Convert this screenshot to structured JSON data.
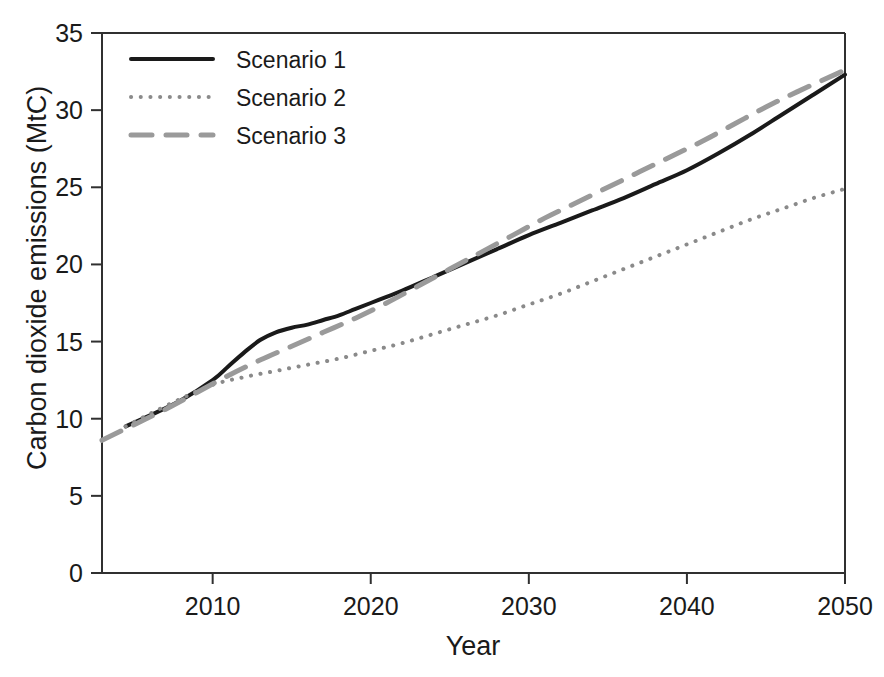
{
  "chart_data": {
    "type": "line",
    "title": "",
    "xlabel": "Year",
    "ylabel": "Carbon dioxide emissions (MtC)",
    "xlim": [
      2003,
      2050
    ],
    "ylim": [
      0,
      35
    ],
    "xticks": [
      2010,
      2020,
      2030,
      2040,
      2050
    ],
    "xtick_labels": [
      "2010",
      "2020",
      "2030",
      "2040",
      "2050"
    ],
    "yticks": [
      0,
      5,
      10,
      15,
      20,
      25,
      30,
      35
    ],
    "ytick_labels": [
      "0",
      "5",
      "10",
      "15",
      "20",
      "25",
      "30",
      "35"
    ],
    "grid": false,
    "legend_position": "upper left",
    "series": [
      {
        "name": "Scenario 1",
        "style": "solid",
        "color": "#1a1a1a",
        "width": 4.0,
        "x": [
          2004.5,
          2006,
          2008,
          2010,
          2011,
          2012,
          2013,
          2014,
          2015,
          2016,
          2017,
          2018,
          2019,
          2020,
          2021,
          2022,
          2024,
          2026,
          2028,
          2030,
          2032,
          2034,
          2036,
          2038,
          2040,
          2042,
          2044,
          2046,
          2048,
          2050
        ],
        "y": [
          9.5,
          10.2,
          11.2,
          12.5,
          13.4,
          14.3,
          15.1,
          15.6,
          15.9,
          16.1,
          16.4,
          16.7,
          17.1,
          17.5,
          17.9,
          18.3,
          19.2,
          20.1,
          21.0,
          21.9,
          22.7,
          23.5,
          24.3,
          25.2,
          26.1,
          27.2,
          28.4,
          29.7,
          31.0,
          32.3
        ]
      },
      {
        "name": "Scenario 2",
        "style": "dotted",
        "color": "#8a8a8a",
        "width": 4.0,
        "x": [
          2004.5,
          2006,
          2008,
          2010,
          2012,
          2014,
          2016,
          2018,
          2020,
          2022,
          2024,
          2026,
          2028,
          2030,
          2032,
          2034,
          2036,
          2038,
          2040,
          2042,
          2044,
          2046,
          2048,
          2050
        ],
        "y": [
          9.5,
          10.3,
          11.3,
          12.2,
          12.7,
          13.1,
          13.5,
          13.9,
          14.4,
          14.9,
          15.5,
          16.1,
          16.7,
          17.4,
          18.1,
          18.9,
          19.7,
          20.5,
          21.3,
          22.1,
          22.9,
          23.6,
          24.3,
          24.9
        ]
      },
      {
        "name": "Scenario 3",
        "style": "dashed",
        "color": "#9a9a9a",
        "width": 5.0,
        "x": [
          2003,
          2005,
          2007,
          2009,
          2011,
          2013,
          2015,
          2017,
          2019,
          2021,
          2023,
          2025,
          2027,
          2029,
          2031,
          2033,
          2035,
          2037,
          2039,
          2041,
          2043,
          2045,
          2047,
          2050
        ],
        "y": [
          8.6,
          9.6,
          10.6,
          11.7,
          12.8,
          13.8,
          14.7,
          15.6,
          16.5,
          17.5,
          18.6,
          19.7,
          20.8,
          21.9,
          23.0,
          24.0,
          25.0,
          26.0,
          27.0,
          28.0,
          29.1,
          30.2,
          31.2,
          32.6
        ]
      }
    ]
  },
  "legend": {
    "items": [
      {
        "label": "Scenario 1"
      },
      {
        "label": "Scenario 2"
      },
      {
        "label": "Scenario 3"
      }
    ]
  }
}
